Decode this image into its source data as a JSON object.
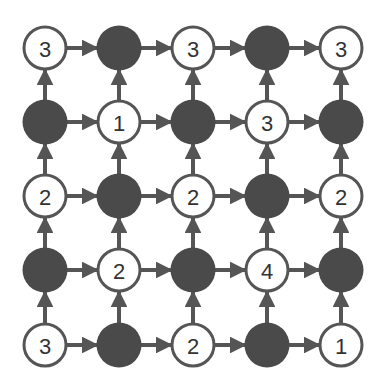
{
  "diagram": {
    "type": "grid-directed-graph",
    "rows": 5,
    "cols": 5,
    "colors": {
      "filled": "#4a4a4a",
      "stroke": "#555555",
      "label": "#333333",
      "background": "#ffffff"
    },
    "grid": [
      [
        "3",
        "filled",
        "3",
        "filled",
        "3"
      ],
      [
        "filled",
        "1",
        "filled",
        "3",
        "filled"
      ],
      [
        "2",
        "filled",
        "2",
        "filled",
        "2"
      ],
      [
        "filled",
        "2",
        "filled",
        "4",
        "filled"
      ],
      [
        "3",
        "filled",
        "2",
        "filled",
        "1"
      ]
    ],
    "edges": {
      "horizontal": "right",
      "vertical": "up"
    }
  }
}
